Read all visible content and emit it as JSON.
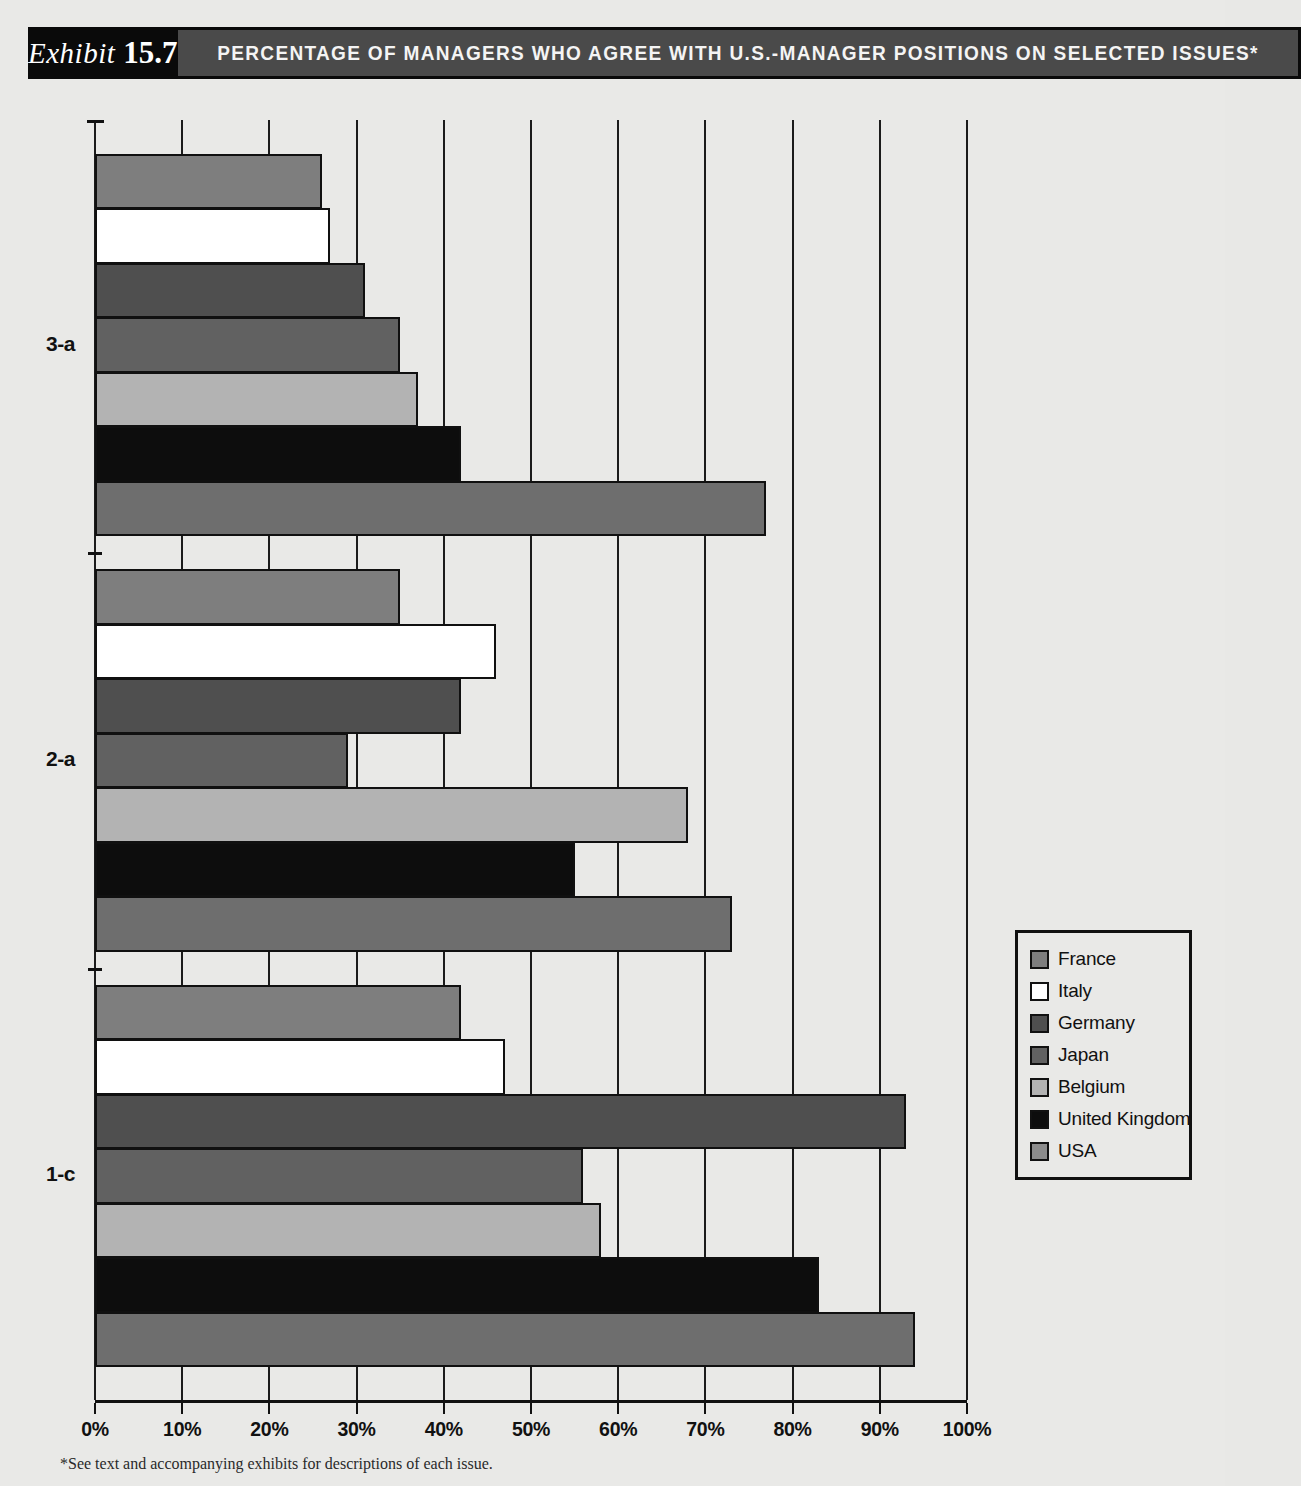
{
  "header": {
    "exhibit_word": "Exhibit",
    "exhibit_number": "15.7",
    "title": "PERCENTAGE OF MANAGERS WHO AGREE WITH U.S.-MANAGER POSITIONS ON SELECTED ISSUES*"
  },
  "footnote": "*See text and accompanying exhibits for descriptions of each issue.",
  "legend": {
    "position": "right",
    "items": [
      {
        "label": "France",
        "color": "#7e7e7e"
      },
      {
        "label": "Italy",
        "color": "#ffffff"
      },
      {
        "label": "Germany",
        "color": "#4f4f4f"
      },
      {
        "label": "Japan",
        "color": "#616161"
      },
      {
        "label": "Belgium",
        "color": "#b3b3b3"
      },
      {
        "label": "United  Kingdom",
        "color": "#0d0d0d"
      },
      {
        "label": "USA",
        "color": "#8c8c8c"
      }
    ]
  },
  "chart_data": {
    "type": "bar",
    "orientation": "horizontal",
    "title": "PERCENTAGE OF MANAGERS WHO AGREE WITH U.S.-MANAGER POSITIONS ON SELECTED ISSUES*",
    "xlabel": "",
    "ylabel": "",
    "xlim": [
      0,
      100
    ],
    "xticks": [
      0,
      10,
      20,
      30,
      40,
      50,
      60,
      70,
      80,
      90,
      100
    ],
    "xtick_labels": [
      "0%",
      "10%",
      "20%",
      "30%",
      "40%",
      "50%",
      "60%",
      "70%",
      "80%",
      "90%",
      "100%"
    ],
    "grid": true,
    "categories": [
      "3-a",
      "2-a",
      "1-c"
    ],
    "series": [
      {
        "name": "France",
        "color": "#7e7e7e",
        "values": [
          26,
          35,
          42
        ]
      },
      {
        "name": "Italy",
        "color": "#ffffff",
        "values": [
          27,
          46,
          47
        ]
      },
      {
        "name": "Germany",
        "color": "#4f4f4f",
        "values": [
          31,
          42,
          93
        ]
      },
      {
        "name": "Japan",
        "color": "#616161",
        "values": [
          35,
          29,
          56
        ]
      },
      {
        "name": "Belgium",
        "color": "#b3b3b3",
        "values": [
          37,
          68,
          58
        ]
      },
      {
        "name": "United Kingdom",
        "color": "#0d0d0d",
        "values": [
          42,
          55,
          83
        ]
      },
      {
        "name": "USA",
        "color": "#6e6e6e",
        "values": [
          77,
          73,
          94
        ]
      }
    ]
  }
}
